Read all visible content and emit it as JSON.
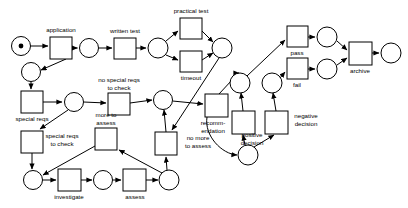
{
  "diagram": {
    "type": "petri-net",
    "colors": {
      "stroke": "#000000",
      "fill": "#ffffff",
      "token": "#000000",
      "background": "#ffffff"
    },
    "places": [
      {
        "id": "p_start",
        "cx": 21,
        "cy": 46,
        "r": 9.5,
        "tokens": 1
      },
      {
        "id": "p_after_app",
        "cx": 89,
        "cy": 48,
        "r": 9.5,
        "tokens": 0
      },
      {
        "id": "p_after_wtest",
        "cx": 158,
        "cy": 48,
        "r": 10,
        "tokens": 0
      },
      {
        "id": "p_after_ptest",
        "cx": 222,
        "cy": 48,
        "r": 10,
        "tokens": 0
      },
      {
        "id": "p_branch_app",
        "cx": 31,
        "cy": 72,
        "r": 9.5,
        "tokens": 0
      },
      {
        "id": "p_special",
        "cx": 74,
        "cy": 102,
        "r": 9.5,
        "tokens": 0
      },
      {
        "id": "p_pre_rec",
        "cx": 163,
        "cy": 100,
        "r": 9.5,
        "tokens": 0
      },
      {
        "id": "p_pass_in",
        "cx": 240,
        "cy": 83,
        "r": 10,
        "tokens": 0
      },
      {
        "id": "p_fail_in",
        "cx": 272,
        "cy": 83,
        "r": 10,
        "tokens": 0
      },
      {
        "id": "p_pass_out",
        "cx": 327,
        "cy": 37,
        "r": 10,
        "tokens": 0
      },
      {
        "id": "p_fail_out",
        "cx": 327,
        "cy": 69,
        "r": 10,
        "tokens": 0
      },
      {
        "id": "p_end",
        "cx": 391,
        "cy": 53,
        "r": 10,
        "tokens": 0
      },
      {
        "id": "p_decision",
        "cx": 248,
        "cy": 155,
        "r": 10,
        "tokens": 0
      },
      {
        "id": "p_invest_in",
        "cx": 33,
        "cy": 180,
        "r": 9.5,
        "tokens": 0
      },
      {
        "id": "p_assess_in",
        "cx": 103,
        "cy": 180,
        "r": 9.5,
        "tokens": 0
      },
      {
        "id": "p_assess_out",
        "cx": 169,
        "cy": 180,
        "r": 10,
        "tokens": 0
      }
    ],
    "transitions": [
      {
        "id": "t_application",
        "x": 50,
        "y": 37,
        "w": 22,
        "h": 22,
        "label": "application",
        "label_x": 61,
        "label_y": 30,
        "lines": [
          "application"
        ]
      },
      {
        "id": "t_written_test",
        "x": 114,
        "y": 38,
        "w": 22,
        "h": 21,
        "label": "written test",
        "label_x": 125,
        "label_y": 31,
        "lines": [
          "written test"
        ]
      },
      {
        "id": "t_practical",
        "x": 180,
        "y": 18,
        "w": 22,
        "h": 21,
        "label": "practical test",
        "label_x": 191,
        "label_y": 11,
        "lines": [
          "practical test"
        ]
      },
      {
        "id": "t_timeout",
        "x": 180,
        "y": 51,
        "w": 22,
        "h": 21,
        "label": "timeout",
        "label_x": 191,
        "label_y": 78,
        "lines": [
          "timeout"
        ]
      },
      {
        "id": "t_pass",
        "x": 287,
        "y": 26,
        "w": 21,
        "h": 21,
        "label": "pass",
        "label_x": 297,
        "label_y": 53,
        "lines": [
          "pass"
        ]
      },
      {
        "id": "t_fail",
        "x": 287,
        "y": 58,
        "w": 21,
        "h": 21,
        "label": "fail",
        "label_x": 297,
        "label_y": 85,
        "lines": [
          "fail"
        ]
      },
      {
        "id": "t_archive",
        "x": 349,
        "y": 42,
        "w": 23,
        "h": 23,
        "label": "archive",
        "label_x": 360,
        "label_y": 71,
        "lines": [
          "archive"
        ]
      },
      {
        "id": "t_special_reqs",
        "x": 21,
        "y": 91,
        "w": 22,
        "h": 22,
        "label": "special reqs",
        "label_x": 32,
        "label_y": 119,
        "lines": [
          "special reqs"
        ]
      },
      {
        "id": "t_no_special",
        "x": 108,
        "y": 93,
        "w": 22,
        "h": 22,
        "label": "no special reqs to check",
        "label_x": 119,
        "label_y": 80,
        "lines": [
          "no special reqs",
          "to check"
        ]
      },
      {
        "id": "t_more_assess",
        "x": 95,
        "y": 128,
        "w": 22,
        "h": 22,
        "label": "more to assess",
        "label_x": 106,
        "label_y": 118,
        "lines": [
          "more to",
          "assess"
        ]
      },
      {
        "id": "t_reqs_to_check",
        "x": 21,
        "y": 131,
        "w": 22,
        "h": 22,
        "label": "special reqs to check",
        "label_x": 58,
        "label_y": 137,
        "lines": [
          "special reqs",
          "to check"
        ]
      },
      {
        "id": "t_investigate",
        "x": 58,
        "y": 169,
        "w": 23,
        "h": 22,
        "label": "investigate",
        "label_x": 69,
        "label_y": 196,
        "lines": [
          "investigate"
        ]
      },
      {
        "id": "t_assess",
        "x": 123,
        "y": 169,
        "w": 23,
        "h": 22,
        "label": "assess",
        "label_x": 134,
        "label_y": 196,
        "lines": [
          "assess"
        ]
      },
      {
        "id": "t_no_more",
        "x": 155,
        "y": 132,
        "w": 22,
        "h": 23,
        "label": "no more to assess",
        "label_x": 198,
        "label_y": 141,
        "lines": [
          "no more",
          "to assess"
        ]
      },
      {
        "id": "t_recommend",
        "x": 205,
        "y": 94,
        "w": 23,
        "h": 23,
        "label": "recomm-endation",
        "label_x": 205,
        "label_y": 124,
        "lines": [
          "recomm-",
          "endation"
        ]
      },
      {
        "id": "t_positive",
        "x": 232,
        "y": 111,
        "w": 23,
        "h": 23,
        "label": "positive decision",
        "label_x": 251,
        "label_y": 135,
        "lines": [
          "positive",
          "decision"
        ]
      },
      {
        "id": "t_negative",
        "x": 265,
        "y": 111,
        "w": 23,
        "h": 23,
        "label": "negative decision",
        "label_x": 306,
        "label_y": 119,
        "lines": [
          "negative",
          "decision"
        ]
      }
    ],
    "labels": [
      {
        "id": "lbl_application",
        "text": "application",
        "x": 61,
        "y": 30
      },
      {
        "id": "lbl_written_test",
        "text": "written test",
        "x": 125,
        "y": 31
      },
      {
        "id": "lbl_practical",
        "text": "practical test",
        "x": 191,
        "y": 11
      },
      {
        "id": "lbl_timeout",
        "text": "timeout",
        "x": 191,
        "y": 78
      },
      {
        "id": "lbl_pass",
        "text": "pass",
        "x": 297,
        "y": 53
      },
      {
        "id": "lbl_fail",
        "text": "fail",
        "x": 297,
        "y": 85
      },
      {
        "id": "lbl_archive",
        "text": "archive",
        "x": 360,
        "y": 71
      },
      {
        "id": "lbl_special_reqs",
        "text": "special reqs",
        "x": 32,
        "y": 119
      },
      {
        "id": "lbl_no_special_1",
        "text": "no special reqs",
        "x": 119,
        "y": 80
      },
      {
        "id": "lbl_no_special_2",
        "text": "to check",
        "x": 119,
        "y": 88
      },
      {
        "id": "lbl_more_1",
        "text": "more to",
        "x": 106,
        "y": 115
      },
      {
        "id": "lbl_more_2",
        "text": "assess",
        "x": 106,
        "y": 123
      },
      {
        "id": "lbl_reqs_check_1",
        "text": "special reqs",
        "x": 62,
        "y": 136
      },
      {
        "id": "lbl_reqs_check_2",
        "text": "to check",
        "x": 62,
        "y": 144
      },
      {
        "id": "lbl_investigate",
        "text": "investigate",
        "x": 69,
        "y": 197
      },
      {
        "id": "lbl_assess",
        "text": "assess",
        "x": 135,
        "y": 197
      },
      {
        "id": "lbl_no_more_1",
        "text": "no more",
        "x": 198,
        "y": 138
      },
      {
        "id": "lbl_no_more_2",
        "text": "to assess",
        "x": 198,
        "y": 146
      },
      {
        "id": "lbl_recomm_1",
        "text": "recomm-",
        "x": 213,
        "y": 123
      },
      {
        "id": "lbl_recomm_2",
        "text": "endation",
        "x": 213,
        "y": 131
      },
      {
        "id": "lbl_positive_1",
        "text": "positive",
        "x": 252,
        "y": 135
      },
      {
        "id": "lbl_positive_2",
        "text": "decision",
        "x": 252,
        "y": 143
      },
      {
        "id": "lbl_negative_1",
        "text": "negative",
        "x": 306,
        "y": 116
      },
      {
        "id": "lbl_negative_2",
        "text": "decision",
        "x": 306,
        "y": 124
      }
    ],
    "arcs": [
      {
        "id": "a_start_app",
        "from": "p_start",
        "to": "t_application",
        "d": "M30.5,46 L48,46"
      },
      {
        "id": "a_app_place",
        "from": "t_application",
        "to": "p_after_app",
        "d": "M72,48 L77.5,48"
      },
      {
        "id": "a_app_branch",
        "from": "t_application",
        "to": "p_branch_app",
        "d": "M66,59 L41,70"
      },
      {
        "id": "a_place_wtest",
        "from": "p_after_app",
        "to": "t_written_test",
        "d": "M98.5,48 L112,48"
      },
      {
        "id": "a_wtest_place",
        "from": "t_written_test",
        "to": "p_after_wtest",
        "d": "M136,48 L146,48"
      },
      {
        "id": "a_place_ptest",
        "from": "p_after_wtest",
        "to": "t_practical",
        "d": "M166,41 L178,31"
      },
      {
        "id": "a_place_timeout",
        "from": "p_after_wtest",
        "to": "t_timeout",
        "d": "M166,55 L178,60"
      },
      {
        "id": "a_ptest_place",
        "from": "t_practical",
        "to": "p_after_ptest",
        "d": "M202,31 L213,42"
      },
      {
        "id": "a_timeout_place",
        "from": "t_timeout",
        "to": "p_after_ptest",
        "d": "M202,60 L213,53"
      },
      {
        "id": "a_ptest_nomore",
        "from": "p_after_ptest",
        "to": "t_no_more",
        "d": "M219,58 L172,130"
      },
      {
        "id": "a_passin_pass",
        "from": "p_pass_in",
        "to": "t_pass",
        "d": "M247,76 L285,40"
      },
      {
        "id": "a_failin_fail",
        "from": "p_fail_in",
        "to": "t_fail",
        "d": "M280,78 L285,72"
      },
      {
        "id": "a_pass_out",
        "from": "t_pass",
        "to": "p_pass_out",
        "d": "M308,37 L315,37"
      },
      {
        "id": "a_fail_out",
        "from": "t_fail",
        "to": "p_fail_out",
        "d": "M308,69 L315,69"
      },
      {
        "id": "a_passout_arch",
        "from": "p_pass_out",
        "to": "t_archive",
        "d": "M337,41 L347,50"
      },
      {
        "id": "a_failout_arch",
        "from": "p_fail_out",
        "to": "t_archive",
        "d": "M337,65 L347,58"
      },
      {
        "id": "a_arch_end",
        "from": "t_archive",
        "to": "p_end",
        "d": "M372,53 L379,53"
      },
      {
        "id": "a_branch_special",
        "from": "p_branch_app",
        "to": "t_special_reqs",
        "d": "M31,81.5 L31,89"
      },
      {
        "id": "a_special_place",
        "from": "t_special_reqs",
        "to": "p_special",
        "d": "M43,102 L62,102"
      },
      {
        "id": "a_place_nospecial",
        "from": "p_special",
        "to": "t_no_special",
        "d": "M83.5,102 L106,103"
      },
      {
        "id": "a_nospecial_pre",
        "from": "t_no_special",
        "to": "p_pre_rec",
        "d": "M130,103 L152,100"
      },
      {
        "id": "a_pre_recommend",
        "from": "p_pre_rec",
        "to": "t_recommend",
        "d": "M172.5,101 L203,104"
      },
      {
        "id": "a_special_reqscheck",
        "from": "p_special",
        "to": "t_reqs_to_check",
        "d": "M68,110 L40,129"
      },
      {
        "id": "a_reqscheck_inv",
        "from": "t_reqs_to_check",
        "to": "p_invest_in",
        "d": "M32,153 L32,169"
      },
      {
        "id": "a_investin_inv",
        "from": "p_invest_in",
        "to": "t_investigate",
        "d": "M42.5,180 L56,180"
      },
      {
        "id": "a_inv_assessin",
        "from": "t_investigate",
        "to": "p_assess_in",
        "d": "M81,180 L92,180"
      },
      {
        "id": "a_assessin_assess",
        "from": "p_assess_in",
        "to": "t_assess",
        "d": "M112.5,180 L121,180"
      },
      {
        "id": "a_assess_out",
        "from": "t_assess",
        "to": "p_assess_out",
        "d": "M146,180 L158,180"
      },
      {
        "id": "a_assessout_more",
        "from": "p_assess_out",
        "to": "t_more_assess",
        "d": "M162,173 L119,150"
      },
      {
        "id": "a_more_investin",
        "from": "t_more_assess",
        "to": "p_invest_in",
        "d": "M95,146 L43,175"
      },
      {
        "id": "a_assessout_nomore",
        "from": "p_assess_out",
        "to": "t_no_more",
        "d": "M167,170 L166,157"
      },
      {
        "id": "a_nomore_pre",
        "from": "t_no_more",
        "to": "p_pre_rec",
        "d": "M166,132 L164,110"
      },
      {
        "id": "a_rec_passin",
        "from": "t_recommend",
        "to": "p_pass_in",
        "d": "M219,94 L232,80 L238,73 L238,73 L239,73"
      },
      {
        "id": "a_rec_decision",
        "from": "t_recommend",
        "to": "p_decision",
        "d": "M207,117 C204,136 222,154 237,155"
      },
      {
        "id": "a_decision_pos",
        "from": "p_decision",
        "to": "t_positive",
        "d": "M245,145 L243,135"
      },
      {
        "id": "a_decision_neg",
        "from": "p_decision",
        "to": "t_negative",
        "d": "M254,147 L274,135"
      },
      {
        "id": "a_pos_passin",
        "from": "t_positive",
        "to": "p_pass_in",
        "d": "M243,111 L241,93"
      },
      {
        "id": "a_neg_failin",
        "from": "t_negative",
        "to": "p_fail_in",
        "d": "M276,111 L273,93"
      }
    ]
  }
}
